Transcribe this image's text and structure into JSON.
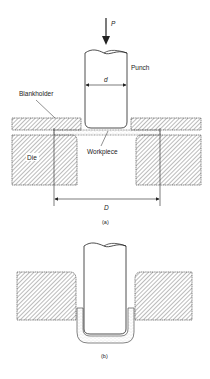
{
  "figure": {
    "panel_a": {
      "caption": "(a)",
      "labels": {
        "force": "P",
        "punch": "Punch",
        "punch_diameter": "d",
        "blankholder": "Blankholder",
        "die": "Die",
        "workpiece": "Workpiece",
        "blank_diameter": "D"
      }
    },
    "panel_b": {
      "caption": "(b)"
    }
  },
  "colors": {
    "line": "#222222",
    "hatch": "#444444",
    "background": "#ffffff"
  }
}
